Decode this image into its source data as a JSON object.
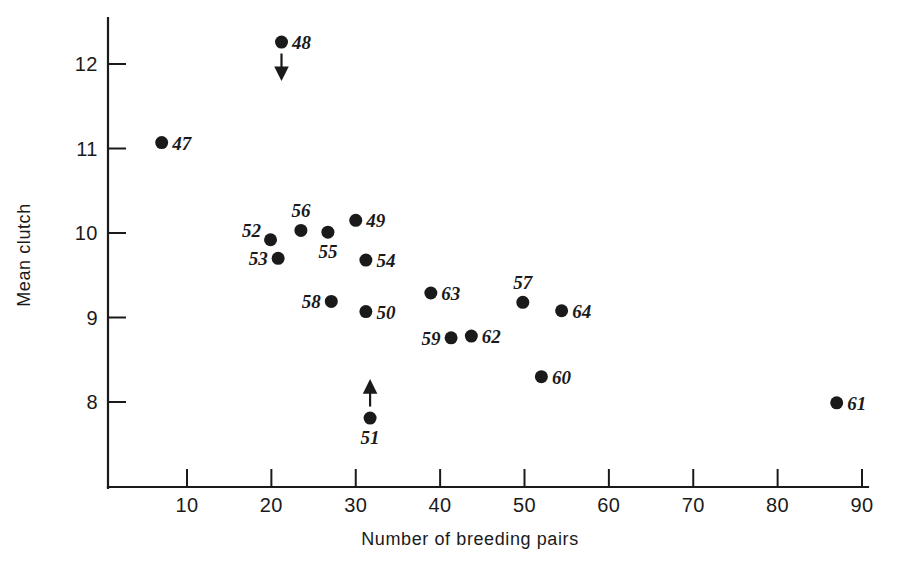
{
  "chart_data": {
    "type": "scatter",
    "title": "",
    "xlabel": "Number of breeding pairs",
    "ylabel": "Mean clutch",
    "xlim": [
      0,
      92
    ],
    "ylim": [
      7.3,
      12.6
    ],
    "xticks": [
      10,
      20,
      30,
      40,
      50,
      60,
      70,
      80,
      90
    ],
    "xtick_labels": [
      "10",
      "20",
      "30",
      "40",
      "50",
      "60",
      "70",
      "80",
      "90"
    ],
    "yticks": [
      8,
      9,
      10,
      11,
      12
    ],
    "ytick_labels": [
      "8",
      "9",
      "10",
      "11",
      "12"
    ],
    "grid": false,
    "legend": null,
    "points": [
      {
        "label": "47",
        "x": 7.0,
        "y": 11.07,
        "label_pos": "right",
        "arrow": null
      },
      {
        "label": "48",
        "x": 21.2,
        "y": 12.26,
        "label_pos": "right",
        "arrow": "down"
      },
      {
        "label": "49",
        "x": 30.0,
        "y": 10.15,
        "label_pos": "right",
        "arrow": null
      },
      {
        "label": "50",
        "x": 31.2,
        "y": 9.07,
        "label_pos": "right",
        "arrow": null
      },
      {
        "label": "51",
        "x": 31.7,
        "y": 7.81,
        "label_pos": "below",
        "arrow": "up"
      },
      {
        "label": "52",
        "x": 19.9,
        "y": 9.92,
        "label_pos": "upleft",
        "arrow": null
      },
      {
        "label": "53",
        "x": 20.8,
        "y": 9.7,
        "label_pos": "left",
        "arrow": null
      },
      {
        "label": "54",
        "x": 31.2,
        "y": 9.68,
        "label_pos": "right",
        "arrow": null
      },
      {
        "label": "55",
        "x": 26.7,
        "y": 10.01,
        "label_pos": "below",
        "arrow": null
      },
      {
        "label": "56",
        "x": 23.5,
        "y": 10.03,
        "label_pos": "above",
        "arrow": null
      },
      {
        "label": "57",
        "x": 49.8,
        "y": 9.18,
        "label_pos": "above",
        "arrow": null
      },
      {
        "label": "58",
        "x": 27.1,
        "y": 9.19,
        "label_pos": "left",
        "arrow": null
      },
      {
        "label": "59",
        "x": 41.3,
        "y": 8.76,
        "label_pos": "left",
        "arrow": null
      },
      {
        "label": "60",
        "x": 52.0,
        "y": 8.3,
        "label_pos": "right",
        "arrow": null
      },
      {
        "label": "61",
        "x": 87.0,
        "y": 7.99,
        "label_pos": "right",
        "arrow": null
      },
      {
        "label": "62",
        "x": 43.7,
        "y": 8.78,
        "label_pos": "right",
        "arrow": null
      },
      {
        "label": "63",
        "x": 38.9,
        "y": 9.29,
        "label_pos": "right",
        "arrow": null
      },
      {
        "label": "64",
        "x": 54.4,
        "y": 9.08,
        "label_pos": "right",
        "arrow": null
      }
    ]
  },
  "axis": {
    "x_title": "Number of breeding pairs",
    "y_title": "Mean clutch"
  }
}
